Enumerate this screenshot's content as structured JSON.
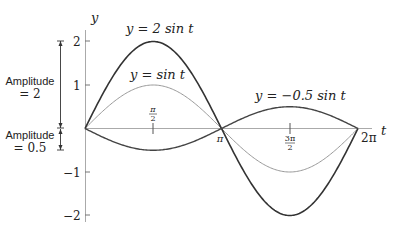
{
  "chart_data": {
    "type": "line",
    "title": "",
    "xlabel": "t",
    "ylabel": "y",
    "xlim": [
      0,
      6.2832
    ],
    "ylim": [
      -2.2,
      2.2
    ],
    "grid": false,
    "x_ticks": [
      "π/2",
      "π",
      "3π/2",
      "2π"
    ],
    "y_ticks": [
      "2",
      "1",
      "−1",
      "−2"
    ],
    "series": [
      {
        "name": "y = 2 sin t",
        "amplitude": 2,
        "color": "#333333",
        "stroke_width": 1.6,
        "x": [
          0,
          1.5708,
          3.1416,
          4.7124,
          6.2832
        ],
        "values": [
          0,
          2,
          0,
          -2,
          0
        ]
      },
      {
        "name": "y = sin t",
        "amplitude": 1,
        "color": "#999999",
        "stroke_width": 1.0,
        "x": [
          0,
          1.5708,
          3.1416,
          4.7124,
          6.2832
        ],
        "values": [
          0,
          1,
          0,
          -1,
          0
        ]
      },
      {
        "name": "y = −0.5 sin t",
        "amplitude": -0.5,
        "color": "#444444",
        "stroke_width": 1.4,
        "x": [
          0,
          1.5708,
          3.1416,
          4.7124,
          6.2832
        ],
        "values": [
          0,
          -0.5,
          0,
          0.5,
          0
        ]
      }
    ],
    "annotations": [
      {
        "text": "Amplitude = 2",
        "range": [
          0,
          2
        ]
      },
      {
        "text": "Amplitude = 0.5",
        "range": [
          -0.5,
          0
        ]
      }
    ]
  },
  "labels": {
    "y_axis": "y",
    "t_axis": "t",
    "curve_2sin": "y = 2 sin t",
    "curve_sin": "y = sin t",
    "curve_neg05sin": "y = −0.5 sin t",
    "tick_y2": "2",
    "tick_y1": "1",
    "tick_ym1": "−1",
    "tick_ym2": "−2",
    "tick_pi_half_num": "π",
    "tick_pi_half_den": "2",
    "tick_pi": "π",
    "tick_3pi_half_num": "3π",
    "tick_3pi_half_den": "2",
    "tick_2pi": "2π",
    "amp2_line1": "Amplitude",
    "amp2_line2": "= 2",
    "amp05_line1": "Amplitude",
    "amp05_line2": "= 0.5"
  }
}
